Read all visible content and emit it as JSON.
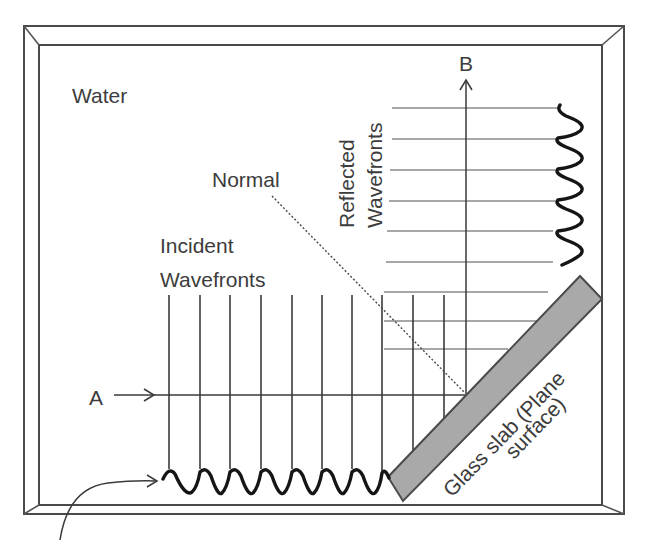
{
  "diagram": {
    "labels": {
      "medium": "Water",
      "normal": "Normal",
      "incident_line1": "Incident",
      "incident_line2": "Wavefronts",
      "reflected_line1": "Reflected",
      "reflected_line2": "Wavefronts",
      "ray_a": "A",
      "ray_b": "B",
      "slab_line1": "Glass slab (Plane",
      "slab_line2": "surface)"
    },
    "colors": {
      "frame": "#4a4a4a",
      "slab_fill": "#a9a9a9",
      "incident_lines": "#2e2e2e",
      "reflected_lines": "#8a8a8a",
      "ripple": "#151515",
      "text": "#3c3c3c"
    },
    "incident_wavefront_count": 10,
    "reflected_wavefront_count": 9
  }
}
